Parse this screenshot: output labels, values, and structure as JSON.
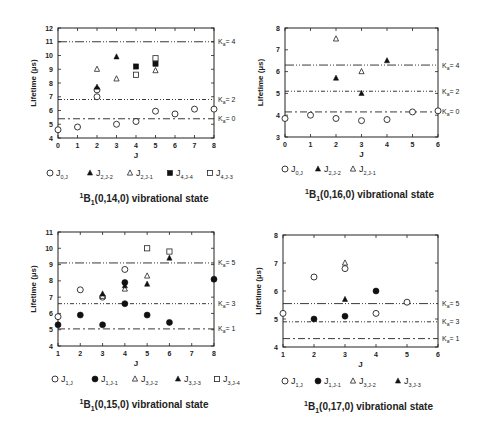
{
  "chart_data": [
    {
      "type": "scatter",
      "id": "p14",
      "title": "1B1(0,14,0) vibrational state",
      "title_parts": {
        "sup": "1",
        "main": "B",
        "sub": "1",
        "rest": "(0,14,0) vibrational state"
      },
      "xlabel": "J",
      "ylabel": "Lifetime  (µs)",
      "xlim": [
        0,
        8
      ],
      "ylim": [
        4,
        12
      ],
      "xticks": [
        0,
        1,
        2,
        3,
        4,
        5,
        6,
        7,
        8
      ],
      "yticks": [
        4,
        5,
        6,
        7,
        8,
        9,
        10,
        11,
        12
      ],
      "box": {
        "x0": 58,
        "x1": 214,
        "y0": 28,
        "y1": 138
      },
      "reference_lines": [
        {
          "label": "Ka = 4",
          "ka": "4",
          "value": 11.0,
          "style": "dash-dot-dot"
        },
        {
          "label": "Ka = 2",
          "ka": "2",
          "value": 6.8,
          "style": "dash-dot-dot-fine"
        },
        {
          "label": "Ka = 0",
          "ka": "0",
          "value": 5.4,
          "style": "dash-dot"
        }
      ],
      "series": [
        {
          "name": "J0,J",
          "main": "J",
          "sub": "0,J",
          "marker": "circle-open",
          "points": [
            [
              0,
              4.6
            ],
            [
              1,
              4.8
            ],
            [
              2,
              7.0
            ],
            [
              2,
              7.5
            ],
            [
              3,
              5.0
            ],
            [
              4,
              5.2
            ],
            [
              5,
              5.95
            ],
            [
              6,
              5.75
            ],
            [
              7,
              6.1
            ],
            [
              8,
              6.1
            ]
          ]
        },
        {
          "name": "J2,J-2",
          "main": "J",
          "sub": "2,J-2",
          "marker": "triangle-filled",
          "points": [
            [
              2,
              7.7
            ],
            [
              3,
              9.9
            ]
          ]
        },
        {
          "name": "J2,J-1",
          "main": "J",
          "sub": "2,J-1",
          "marker": "triangle-open",
          "points": [
            [
              2,
              9.0
            ],
            [
              3,
              8.3
            ],
            [
              5,
              8.9
            ]
          ]
        },
        {
          "name": "J4,J-4",
          "main": "J",
          "sub": "4,J-4",
          "marker": "square-filled",
          "points": [
            [
              4,
              9.2
            ],
            [
              5,
              9.4
            ]
          ]
        },
        {
          "name": "J4,J-3",
          "main": "J",
          "sub": "4,J-3",
          "marker": "square-open",
          "points": [
            [
              4,
              8.6
            ],
            [
              5,
              9.8
            ]
          ]
        }
      ],
      "legend": {
        "y": 176,
        "x": [
          50,
          90,
          130,
          170,
          210
        ]
      },
      "title_y": 202
    },
    {
      "type": "scatter",
      "id": "p16",
      "title": "1B1(0,16,0) vibrational state",
      "title_parts": {
        "sup": "1",
        "main": "B",
        "sub": "1",
        "rest": "(0,16,0) vibrational state"
      },
      "xlabel": "J",
      "ylabel": "Lifetime  (µs)",
      "xlim": [
        0,
        6
      ],
      "ylim": [
        3,
        8
      ],
      "xticks": [
        0,
        1,
        2,
        3,
        4,
        5,
        6
      ],
      "yticks": [
        3,
        4,
        5,
        6,
        7,
        8
      ],
      "box": {
        "x0": 285,
        "x1": 438,
        "y0": 28,
        "y1": 137
      },
      "reference_lines": [
        {
          "label": "Ka = 4",
          "ka": "4",
          "value": 6.3,
          "style": "dash-dot-dot"
        },
        {
          "label": "Ka = 2",
          "ka": "2",
          "value": 5.1,
          "style": "dash-dot-dot-fine"
        },
        {
          "label": "Ka = 0",
          "ka": "0",
          "value": 4.15,
          "style": "dash-dot"
        }
      ],
      "series": [
        {
          "name": "J0,J",
          "main": "J",
          "sub": "0,J",
          "marker": "circle-open",
          "points": [
            [
              0,
              3.85
            ],
            [
              1,
              4.0
            ],
            [
              2,
              3.85
            ],
            [
              3,
              3.75
            ],
            [
              4,
              3.8
            ],
            [
              5,
              4.15
            ],
            [
              6,
              4.2
            ]
          ]
        },
        {
          "name": "J2,J-2",
          "main": "J",
          "sub": "2,J-2",
          "marker": "triangle-filled",
          "points": [
            [
              2,
              5.7
            ],
            [
              3,
              5.0
            ],
            [
              4,
              6.5
            ]
          ]
        },
        {
          "name": "J2,J-1",
          "main": "J",
          "sub": "2,J-1",
          "marker": "triangle-open",
          "points": [
            [
              2,
              7.5
            ],
            [
              3,
              6.0
            ]
          ]
        }
      ],
      "legend": {
        "y": 172,
        "x": [
          285,
          318,
          353
        ]
      },
      "title_y": 198
    },
    {
      "type": "scatter",
      "id": "p15",
      "title": "1B1(0,15,0) vibrational state",
      "title_parts": {
        "sup": "1",
        "main": "B",
        "sub": "1",
        "rest": "(0,15,0) vibrational state"
      },
      "xlabel": "J",
      "ylabel": "Lifetime  (µs)",
      "xlim": [
        1,
        8
      ],
      "ylim": [
        4,
        11
      ],
      "xticks": [
        1,
        2,
        3,
        4,
        5,
        6,
        7,
        8
      ],
      "yticks": [
        4,
        5,
        6,
        7,
        8,
        9,
        10,
        11
      ],
      "box": {
        "x0": 58,
        "x1": 214,
        "y0": 232,
        "y1": 346
      },
      "reference_lines": [
        {
          "label": "Ka = 5",
          "ka": "5",
          "value": 9.1,
          "style": "dash-dot-dot"
        },
        {
          "label": "Ka = 3",
          "ka": "3",
          "value": 6.6,
          "style": "dash-dot-dot-fine"
        },
        {
          "label": "Ka = 1",
          "ka": "1",
          "value": 5.05,
          "style": "dash-dot"
        }
      ],
      "series": [
        {
          "name": "J1,J",
          "main": "J",
          "sub": "1,J",
          "marker": "circle-open",
          "points": [
            [
              1,
              5.8
            ],
            [
              2,
              7.45
            ],
            [
              3,
              7.0
            ],
            [
              4,
              8.7
            ]
          ]
        },
        {
          "name": "J1,J-1",
          "main": "J",
          "sub": "1,J-1",
          "marker": "circle-filled",
          "points": [
            [
              1,
              5.3
            ],
            [
              2,
              5.9
            ],
            [
              3,
              5.3
            ],
            [
              4,
              7.9
            ],
            [
              4,
              6.6
            ],
            [
              5,
              5.9
            ],
            [
              6,
              5.45
            ],
            [
              8,
              8.1
            ]
          ]
        },
        {
          "name": "J3,J-2",
          "main": "J",
          "sub": "3,J-2",
          "marker": "triangle-open",
          "points": [
            [
              3,
              7.05
            ],
            [
              4,
              7.5
            ],
            [
              5,
              8.3
            ]
          ]
        },
        {
          "name": "J3,J-3",
          "main": "J",
          "sub": "3,J-3",
          "marker": "triangle-filled",
          "points": [
            [
              3,
              7.2
            ],
            [
              4,
              7.7
            ],
            [
              5,
              7.8
            ],
            [
              6,
              9.4
            ]
          ]
        },
        {
          "name": "J3,J-4",
          "main": "J",
          "sub": "3,J-4",
          "marker": "square-open",
          "points": [
            [
              5,
              10.0
            ],
            [
              6,
              9.8
            ]
          ]
        }
      ],
      "legend": {
        "y": 382,
        "x": [
          55,
          95,
          135,
          178,
          217
        ]
      },
      "title_y": 408
    },
    {
      "type": "scatter",
      "id": "p17",
      "title": "1B1(0,17,0) vibrational state",
      "title_parts": {
        "sup": "1",
        "main": "B",
        "sub": "1",
        "rest": "(0,17,0) vibrational state"
      },
      "xlabel": "J",
      "ylabel": "Lifetime  (µs)",
      "xlim": [
        1,
        6
      ],
      "ylim": [
        4,
        8
      ],
      "xticks": [
        1,
        2,
        3,
        4,
        5,
        6
      ],
      "yticks": [
        4,
        5,
        6,
        7,
        8
      ],
      "box": {
        "x0": 283,
        "x1": 438,
        "y0": 235,
        "y1": 347
      },
      "reference_lines": [
        {
          "label": "Ka = 5",
          "ka": "5",
          "value": 5.55,
          "style": "dash-dot-dot"
        },
        {
          "label": "Ka = 3",
          "ka": "3",
          "value": 4.9,
          "style": "dash-dot-dot-fine"
        },
        {
          "label": "Ka = 1",
          "ka": "1",
          "value": 4.3,
          "style": "dash-dot"
        }
      ],
      "series": [
        {
          "name": "J1,J",
          "main": "J",
          "sub": "1,J",
          "marker": "circle-open",
          "points": [
            [
              1,
              5.2
            ],
            [
              2,
              6.5
            ],
            [
              3,
              6.8
            ],
            [
              4,
              5.2
            ],
            [
              5,
              5.6
            ]
          ]
        },
        {
          "name": "J1,J-1",
          "main": "J",
          "sub": "1,J-1",
          "marker": "circle-filled",
          "points": [
            [
              2,
              5.0
            ],
            [
              3,
              5.1
            ],
            [
              4,
              6.0
            ]
          ]
        },
        {
          "name": "J3,J-2",
          "main": "J",
          "sub": "3,J-2",
          "marker": "triangle-open",
          "points": [
            [
              3,
              7.0
            ]
          ]
        },
        {
          "name": "J3,J-3",
          "main": "J",
          "sub": "3,J-3",
          "marker": "triangle-filled",
          "points": [
            [
              3,
              5.7
            ]
          ]
        }
      ],
      "legend": {
        "y": 384,
        "x": [
          285,
          318,
          353,
          398
        ]
      },
      "title_y": 410
    }
  ]
}
